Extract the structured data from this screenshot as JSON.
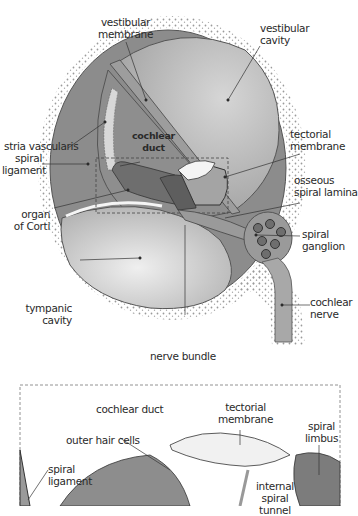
{
  "diagram": {
    "colors": {
      "outer_wall": "#7a7a7a",
      "cavity_fill": "#bdbdbd",
      "duct_fill": "#8f8f8f",
      "bone_dots": "#9a9a9a",
      "membrane_fill": "#f2f2f2",
      "limbus_fill": "#8a8a8a",
      "line": "#333333"
    },
    "top_labels": {
      "vestibular_membrane": "vestibular\nmembrane",
      "vestibular_cavity": "vestibular\ncavity",
      "stria_vascularis": "stria vascularis",
      "tectorial_membrane": "tectorial\nmembrane",
      "spiral_ligament": "spiral\nligament",
      "cochlear_duct": "cochlear\nduct",
      "osseous_spiral_lamina": "osseous\nspiral lamina",
      "organ_of_corti": "organ\nof Corti",
      "spiral_ganglion": "spiral\nganglion",
      "tympanic_cavity": "tympanic\ncavity",
      "cochlear_nerve": "cochlear\nnerve",
      "nerve_bundle": "nerve bundle"
    },
    "detail_labels": {
      "cochlear_duct": "cochlear duct",
      "tectorial_membrane": "tectorial\nmembrane",
      "spiral_limbus": "spiral\nlimbus",
      "outer_hair_cells": "outer hair cells",
      "spiral_ligament": "spiral\nligament",
      "internal_spiral_tunnel": "internal\nspiral\ntunnel"
    }
  }
}
